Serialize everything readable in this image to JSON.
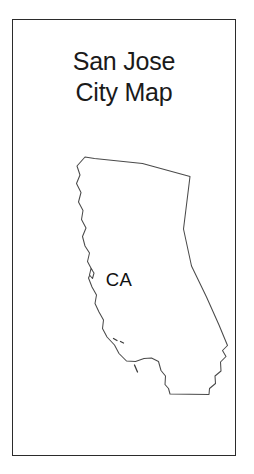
{
  "card": {
    "border_color": "#2b2b2b",
    "background_color": "#ffffff"
  },
  "title": {
    "line1": "San Jose",
    "line2": "City Map"
  },
  "map": {
    "state_label": "CA",
    "outline_color": "#4a4a4a",
    "fill_color": "#ffffff",
    "island_marks": 3
  }
}
